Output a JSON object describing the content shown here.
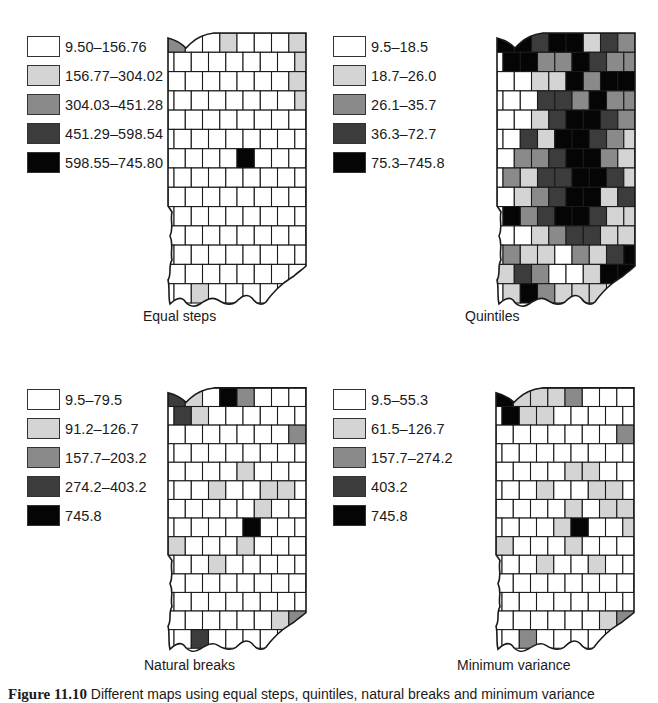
{
  "colors": {
    "class1": "#ffffff",
    "class2": "#d4d4d4",
    "class3": "#8a8a8a",
    "class4": "#3c3c3c",
    "class5": "#050505",
    "border": "#1a1a1a"
  },
  "panels": [
    {
      "id": "equal-steps",
      "caption": "Equal steps",
      "legend": [
        {
          "label": "9.50–156.76",
          "class": 1
        },
        {
          "label": "156.77–304.02",
          "class": 2
        },
        {
          "label": "304.03–451.28",
          "class": 3
        },
        {
          "label": "451.29–598.54",
          "class": 4
        },
        {
          "label": "598.55–745.80",
          "class": 5
        }
      ]
    },
    {
      "id": "quintiles",
      "caption": "Quintiles",
      "legend": [
        {
          "label": "9.5–18.5",
          "class": 1
        },
        {
          "label": "18.7–26.0",
          "class": 2
        },
        {
          "label": "26.1–35.7",
          "class": 3
        },
        {
          "label": "36.3–72.7",
          "class": 4
        },
        {
          "label": "75.3–745.8",
          "class": 5
        }
      ]
    },
    {
      "id": "natural-breaks",
      "caption": "Natural breaks",
      "legend": [
        {
          "label": "9.5–79.5",
          "class": 1
        },
        {
          "label": "91.2–126.7",
          "class": 2
        },
        {
          "label": "157.7–203.2",
          "class": 3
        },
        {
          "label": "274.2–403.2",
          "class": 4
        },
        {
          "label": "745.8",
          "class": 5
        }
      ]
    },
    {
      "id": "minimum-variance",
      "caption": "Minimum variance",
      "legend": [
        {
          "label": "9.5–55.3",
          "class": 1
        },
        {
          "label": "61.5–126.7",
          "class": 2
        },
        {
          "label": "157.7–274.2",
          "class": 3
        },
        {
          "label": "403.2",
          "class": 4
        },
        {
          "label": "745.8",
          "class": 5
        }
      ]
    }
  ],
  "figure_caption": {
    "number": "Figure 11.10",
    "text": "Different maps using equal steps, quintiles, natural breaks and minimum variance"
  }
}
